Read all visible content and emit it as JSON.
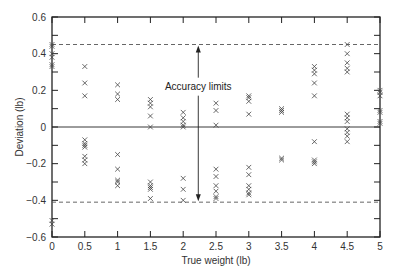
{
  "chart_data": {
    "type": "scatter",
    "title": "",
    "xlabel": "True weight (lb)",
    "ylabel": "Deviation (lb)",
    "xlim": [
      0,
      5
    ],
    "ylim": [
      -0.6,
      0.6
    ],
    "xticks": [
      0,
      0.5,
      1,
      1.5,
      2,
      2.5,
      3,
      3.5,
      4,
      4.5,
      5
    ],
    "xtick_labels": [
      "0",
      "0.5",
      "1",
      "1.5",
      "2",
      "2.5",
      "3",
      "3.5",
      "4",
      "4.5",
      "5"
    ],
    "yticks": [
      -0.6,
      -0.4,
      -0.2,
      0,
      0.2,
      0.4,
      0.6
    ],
    "ytick_labels": [
      "−0.6",
      "−0.4",
      "−0.2",
      "0",
      "0.2",
      "0.4",
      "0.6"
    ],
    "grid": false,
    "marker": "x",
    "reference_lines": [
      {
        "name": "upper accuracy limit",
        "y": 0.45,
        "style": "dashed"
      },
      {
        "name": "zero line",
        "y": 0,
        "style": "solid"
      },
      {
        "name": "lower accuracy limit",
        "y": -0.41,
        "style": "dashed"
      }
    ],
    "annotations": [
      {
        "text": "Accuracy limits",
        "x": 2.23,
        "y": 0.22,
        "arrows_to": [
          0.45,
          -0.41
        ]
      }
    ],
    "series": [
      {
        "name": "Deviation",
        "points": [
          [
            0,
            0.45
          ],
          [
            0,
            0.44
          ],
          [
            0,
            0.4
          ],
          [
            0,
            0.38
          ],
          [
            0,
            0.34
          ],
          [
            0,
            0.33
          ],
          [
            0,
            -0.51
          ],
          [
            0,
            -0.53
          ],
          [
            0.5,
            0.33
          ],
          [
            0.5,
            0.24
          ],
          [
            0.5,
            0.17
          ],
          [
            0.5,
            -0.07
          ],
          [
            0.5,
            -0.09
          ],
          [
            0.5,
            -0.1
          ],
          [
            0.5,
            -0.11
          ],
          [
            0.5,
            -0.16
          ],
          [
            0.5,
            -0.18
          ],
          [
            0.5,
            -0.2
          ],
          [
            1,
            0.23
          ],
          [
            1,
            0.18
          ],
          [
            1,
            0.15
          ],
          [
            1,
            -0.15
          ],
          [
            1,
            -0.23
          ],
          [
            1,
            -0.29
          ],
          [
            1,
            -0.3
          ],
          [
            1,
            -0.32
          ],
          [
            1.5,
            0.15
          ],
          [
            1.5,
            0.13
          ],
          [
            1.5,
            0.11
          ],
          [
            1.5,
            0.06
          ],
          [
            1.5,
            0.0
          ],
          [
            1.5,
            -0.3
          ],
          [
            1.5,
            -0.32
          ],
          [
            1.5,
            -0.33
          ],
          [
            1.5,
            -0.34
          ],
          [
            1.5,
            -0.39
          ],
          [
            2,
            0.08
          ],
          [
            2,
            0.05
          ],
          [
            2,
            0.03
          ],
          [
            2,
            0.01
          ],
          [
            2,
            0.0
          ],
          [
            2,
            -0.28
          ],
          [
            2,
            -0.34
          ],
          [
            2,
            -0.4
          ],
          [
            2.5,
            0.13
          ],
          [
            2.5,
            0.09
          ],
          [
            2.5,
            0.01
          ],
          [
            2.5,
            -0.23
          ],
          [
            2.5,
            -0.27
          ],
          [
            2.5,
            -0.32
          ],
          [
            2.5,
            -0.35
          ],
          [
            2.5,
            -0.38
          ],
          [
            2.5,
            -0.39
          ],
          [
            3,
            0.17
          ],
          [
            3,
            0.16
          ],
          [
            3,
            0.14
          ],
          [
            3,
            0.07
          ],
          [
            3,
            -0.22
          ],
          [
            3,
            -0.26
          ],
          [
            3,
            -0.32
          ],
          [
            3,
            -0.34
          ],
          [
            3,
            -0.36
          ],
          [
            3,
            -0.37
          ],
          [
            3.5,
            0.1
          ],
          [
            3.5,
            0.09
          ],
          [
            3.5,
            0.08
          ],
          [
            3.5,
            -0.17
          ],
          [
            3.5,
            -0.18
          ],
          [
            4,
            0.33
          ],
          [
            4,
            0.31
          ],
          [
            4,
            0.29
          ],
          [
            4,
            0.24
          ],
          [
            4,
            0.17
          ],
          [
            4,
            -0.08
          ],
          [
            4,
            -0.18
          ],
          [
            4,
            -0.19
          ],
          [
            4,
            -0.2
          ],
          [
            4.5,
            0.45
          ],
          [
            4.5,
            0.4
          ],
          [
            4.5,
            0.35
          ],
          [
            4.5,
            0.32
          ],
          [
            4.5,
            0.3
          ],
          [
            4.5,
            0.07
          ],
          [
            4.5,
            0.05
          ],
          [
            4.5,
            0.03
          ],
          [
            4.5,
            -0.01
          ],
          [
            4.5,
            -0.03
          ],
          [
            4.5,
            -0.05
          ],
          [
            4.5,
            -0.08
          ],
          [
            5,
            0.2
          ],
          [
            5,
            0.19
          ],
          [
            5,
            0.17
          ],
          [
            5,
            0.09
          ],
          [
            5,
            0.08
          ],
          [
            5,
            0.03
          ],
          [
            5,
            0.02
          ]
        ]
      }
    ]
  },
  "colors": {
    "axis": "#222222",
    "marker": "#444444",
    "reference": "#555555"
  }
}
